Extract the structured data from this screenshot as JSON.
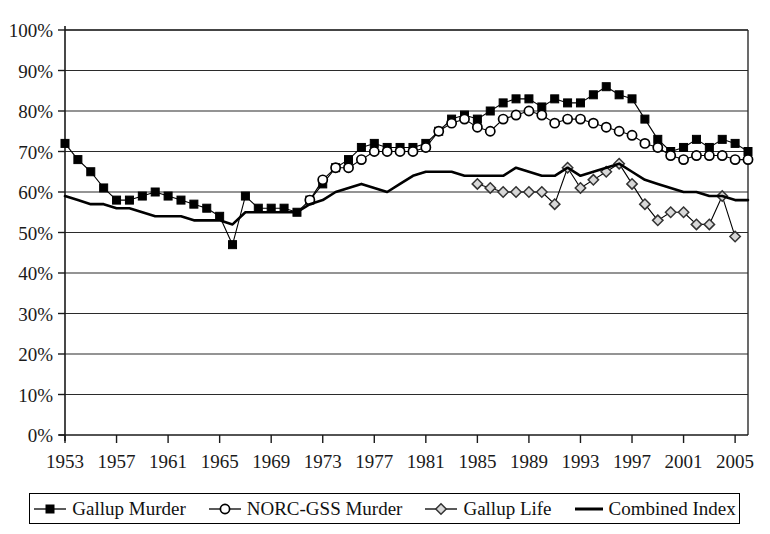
{
  "chart_data": {
    "type": "line",
    "title": "",
    "xlabel": "",
    "ylabel": "",
    "xlim": [
      1953,
      2006
    ],
    "ylim": [
      0,
      100
    ],
    "y_tick_labels": [
      "0%",
      "10%",
      "20%",
      "30%",
      "40%",
      "50%",
      "60%",
      "70%",
      "80%",
      "90%",
      "100%"
    ],
    "y_ticks": [
      0,
      10,
      20,
      30,
      40,
      50,
      60,
      70,
      80,
      90,
      100
    ],
    "x_tick_labels": [
      "1953",
      "1957",
      "1961",
      "1965",
      "1969",
      "1973",
      "1977",
      "1981",
      "1985",
      "1989",
      "1993",
      "1997",
      "2001",
      "2005"
    ],
    "x_ticks": [
      1953,
      1957,
      1961,
      1965,
      1969,
      1973,
      1977,
      1981,
      1985,
      1989,
      1993,
      1997,
      2001,
      2005
    ],
    "grid": "horizontal",
    "legend_position": "bottom",
    "series": [
      {
        "name": "Gallup Murder",
        "marker": "filled-square",
        "color": "#000000",
        "points": [
          [
            1953,
            72
          ],
          [
            1954,
            68
          ],
          [
            1955,
            65
          ],
          [
            1956,
            61
          ],
          [
            1957,
            58
          ],
          [
            1958,
            58
          ],
          [
            1959,
            59
          ],
          [
            1960,
            60
          ],
          [
            1961,
            59
          ],
          [
            1962,
            58
          ],
          [
            1963,
            57
          ],
          [
            1964,
            56
          ],
          [
            1965,
            54
          ],
          [
            1966,
            47
          ],
          [
            1967,
            59
          ],
          [
            1968,
            56
          ],
          [
            1969,
            56
          ],
          [
            1970,
            56
          ],
          [
            1971,
            55
          ],
          [
            1972,
            58
          ],
          [
            1973,
            62
          ],
          [
            1974,
            66
          ],
          [
            1975,
            68
          ],
          [
            1976,
            71
          ],
          [
            1977,
            72
          ],
          [
            1978,
            71
          ],
          [
            1979,
            71
          ],
          [
            1980,
            71
          ],
          [
            1981,
            72
          ],
          [
            1982,
            75
          ],
          [
            1983,
            78
          ],
          [
            1984,
            79
          ],
          [
            1985,
            78
          ],
          [
            1986,
            80
          ],
          [
            1987,
            82
          ],
          [
            1988,
            83
          ],
          [
            1989,
            83
          ],
          [
            1990,
            81
          ],
          [
            1991,
            83
          ],
          [
            1992,
            82
          ],
          [
            1993,
            82
          ],
          [
            1994,
            84
          ],
          [
            1995,
            86
          ],
          [
            1996,
            84
          ],
          [
            1997,
            83
          ],
          [
            1998,
            78
          ],
          [
            1999,
            73
          ],
          [
            2000,
            70
          ],
          [
            2001,
            71
          ],
          [
            2002,
            73
          ],
          [
            2003,
            71
          ],
          [
            2004,
            73
          ],
          [
            2005,
            72
          ],
          [
            2006,
            70
          ]
        ]
      },
      {
        "name": "NORC-GSS Murder",
        "marker": "open-circle",
        "color": "#000000",
        "points": [
          [
            1972,
            58
          ],
          [
            1973,
            63
          ],
          [
            1974,
            66
          ],
          [
            1975,
            66
          ],
          [
            1976,
            68
          ],
          [
            1977,
            70
          ],
          [
            1978,
            70
          ],
          [
            1979,
            70
          ],
          [
            1980,
            70
          ],
          [
            1981,
            71
          ],
          [
            1982,
            75
          ],
          [
            1983,
            77
          ],
          [
            1984,
            78
          ],
          [
            1985,
            76
          ],
          [
            1986,
            75
          ],
          [
            1987,
            78
          ],
          [
            1988,
            79
          ],
          [
            1989,
            80
          ],
          [
            1990,
            79
          ],
          [
            1991,
            77
          ],
          [
            1992,
            78
          ],
          [
            1993,
            78
          ],
          [
            1994,
            77
          ],
          [
            1995,
            76
          ],
          [
            1996,
            75
          ],
          [
            1997,
            74
          ],
          [
            1998,
            72
          ],
          [
            1999,
            71
          ],
          [
            2000,
            69
          ],
          [
            2001,
            68
          ],
          [
            2002,
            69
          ],
          [
            2003,
            69
          ],
          [
            2004,
            69
          ],
          [
            2005,
            68
          ],
          [
            2006,
            68
          ]
        ]
      },
      {
        "name": "Gallup Life",
        "marker": "open-diamond",
        "color": "#000000",
        "points": [
          [
            1985,
            62
          ],
          [
            1986,
            61
          ],
          [
            1987,
            60
          ],
          [
            1988,
            60
          ],
          [
            1989,
            60
          ],
          [
            1990,
            60
          ],
          [
            1991,
            57
          ],
          [
            1992,
            66
          ],
          [
            1993,
            61
          ],
          [
            1994,
            63
          ],
          [
            1995,
            65
          ],
          [
            1996,
            67
          ],
          [
            1997,
            62
          ],
          [
            1998,
            57
          ],
          [
            1999,
            53
          ],
          [
            2000,
            55
          ],
          [
            2001,
            55
          ],
          [
            2002,
            52
          ],
          [
            2003,
            52
          ],
          [
            2004,
            59
          ],
          [
            2005,
            49
          ]
        ]
      },
      {
        "name": "Combined Index",
        "marker": "line",
        "color": "#000000",
        "points": [
          [
            1953,
            59
          ],
          [
            1954,
            58
          ],
          [
            1955,
            57
          ],
          [
            1956,
            57
          ],
          [
            1957,
            56
          ],
          [
            1958,
            56
          ],
          [
            1959,
            55
          ],
          [
            1960,
            54
          ],
          [
            1961,
            54
          ],
          [
            1962,
            54
          ],
          [
            1963,
            53
          ],
          [
            1964,
            53
          ],
          [
            1965,
            53
          ],
          [
            1966,
            52
          ],
          [
            1967,
            55
          ],
          [
            1968,
            55
          ],
          [
            1969,
            55
          ],
          [
            1970,
            55
          ],
          [
            1971,
            55
          ],
          [
            1972,
            57
          ],
          [
            1973,
            58
          ],
          [
            1974,
            60
          ],
          [
            1975,
            61
          ],
          [
            1976,
            62
          ],
          [
            1977,
            61
          ],
          [
            1978,
            60
          ],
          [
            1979,
            62
          ],
          [
            1980,
            64
          ],
          [
            1981,
            65
          ],
          [
            1982,
            65
          ],
          [
            1983,
            65
          ],
          [
            1984,
            64
          ],
          [
            1985,
            64
          ],
          [
            1986,
            64
          ],
          [
            1987,
            64
          ],
          [
            1988,
            66
          ],
          [
            1989,
            65
          ],
          [
            1990,
            64
          ],
          [
            1991,
            64
          ],
          [
            1992,
            66
          ],
          [
            1993,
            64
          ],
          [
            1994,
            65
          ],
          [
            1995,
            66
          ],
          [
            1996,
            67
          ],
          [
            1997,
            65
          ],
          [
            1998,
            63
          ],
          [
            1999,
            62
          ],
          [
            2000,
            61
          ],
          [
            2001,
            60
          ],
          [
            2002,
            60
          ],
          [
            2003,
            59
          ],
          [
            2004,
            59
          ],
          [
            2005,
            58
          ],
          [
            2006,
            58
          ]
        ]
      }
    ]
  },
  "legend": {
    "items": [
      {
        "label": "Gallup Murder",
        "marker": "filled-square"
      },
      {
        "label": "NORC-GSS Murder",
        "marker": "open-circle"
      },
      {
        "label": "Gallup Life",
        "marker": "open-diamond"
      },
      {
        "label": "Combined Index",
        "marker": "line"
      }
    ]
  }
}
